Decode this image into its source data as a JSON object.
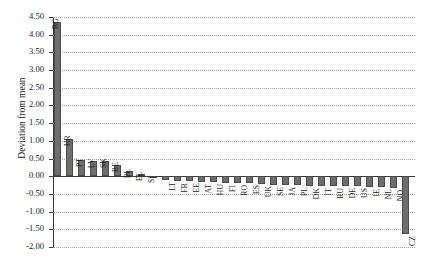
{
  "chart_data": {
    "type": "bar",
    "title": "",
    "xlabel": "",
    "ylabel": "Deviation from mean",
    "ylim": [
      -2.0,
      4.5
    ],
    "ytick_labels": [
      "4.50",
      "4.00",
      "3.50",
      "3.00",
      "2.50",
      "2.00",
      "1.50",
      "1.00",
      "0.50",
      "0.00",
      "-0.50",
      "-1.00",
      "-1.50",
      "-2.00"
    ],
    "ytick_values": [
      4.5,
      4.0,
      3.5,
      3.0,
      2.5,
      2.0,
      1.5,
      1.0,
      0.5,
      0.0,
      -0.5,
      -1.0,
      -1.5,
      -2.0
    ],
    "grid": true,
    "legend": "none",
    "bar_color": "#6e6e6e",
    "bar_edge_color": "#4a4a4a",
    "categories": [
      "BG",
      "HR",
      "PT",
      "LV",
      "SK",
      "BE",
      "PL",
      "EL",
      "SI",
      "LT",
      "FR",
      "EE",
      "AT",
      "HU",
      "FI",
      "RO",
      "ES",
      "UK",
      "SE",
      "JA",
      "PL",
      "DK",
      "IT",
      "RU",
      "DE",
      "US",
      "IE",
      "NL",
      "NO",
      "CZ"
    ],
    "values": [
      4.35,
      1.05,
      0.47,
      0.44,
      0.43,
      0.32,
      0.16,
      0.06,
      0.02,
      -0.11,
      -0.13,
      -0.14,
      -0.16,
      -0.17,
      -0.18,
      -0.19,
      -0.2,
      -0.22,
      -0.25,
      -0.25,
      -0.26,
      -0.27,
      -0.27,
      -0.28,
      -0.28,
      -0.29,
      -0.3,
      -0.3,
      -0.32,
      -1.63
    ]
  }
}
